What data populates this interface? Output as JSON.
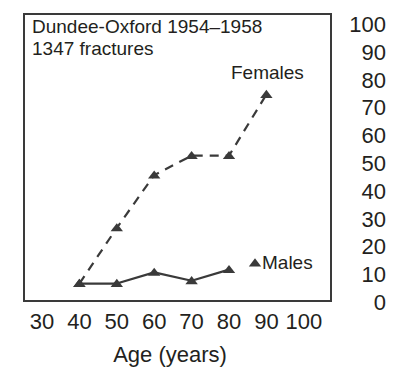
{
  "chart_data": {
    "type": "line",
    "title": "Dundee-Oxford 1954–1958",
    "subtitle": "1347 fractures",
    "xlabel": "Age (years)",
    "ylabel": "",
    "xlim": [
      30,
      100
    ],
    "ylim": [
      0,
      100
    ],
    "xticks": [
      30,
      40,
      50,
      60,
      70,
      80,
      90,
      100
    ],
    "yticks": [
      0,
      10,
      20,
      30,
      40,
      50,
      60,
      70,
      80,
      90,
      100
    ],
    "grid": false,
    "legend": "inline-labels",
    "x": [
      40,
      50,
      60,
      70,
      80,
      90
    ],
    "series": [
      {
        "name": "Females",
        "label": "Females",
        "linestyle": "dashed",
        "marker": "triangle",
        "color": "#3a3a3a",
        "x": [
          40,
          50,
          60,
          70,
          80,
          90
        ],
        "values": [
          7,
          27,
          46,
          53,
          53,
          75
        ]
      },
      {
        "name": "Males",
        "label": "Males",
        "linestyle": "solid",
        "marker": "triangle",
        "color": "#3a3a3a",
        "x": [
          40,
          50,
          60,
          70,
          80
        ],
        "values": [
          7,
          7,
          11,
          8,
          12
        ]
      }
    ]
  },
  "colors": {
    "ink": "#3a3a3a",
    "text": "#231f20",
    "background": "#ffffff"
  }
}
